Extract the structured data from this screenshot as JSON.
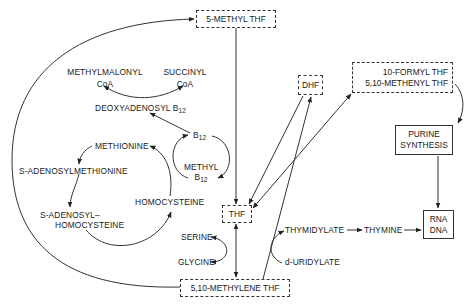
{
  "figure": {
    "type": "metabolic-pathway-diagram",
    "topic": "Folate / B12 one-carbon metabolism"
  },
  "nodes": {
    "methyl_thf": {
      "label": "5-METHYL THF",
      "style": "dashed-box"
    },
    "dhf": {
      "label": "DHF",
      "style": "dashed-box"
    },
    "formyl_thf": {
      "line1": "10-FORMYL THF",
      "line2": "5,10-METHENYL THF",
      "style": "dashed-box"
    },
    "purine": {
      "line1": "PURINE",
      "line2": "SYNTHESIS",
      "style": "solid-box"
    },
    "rna_dna": {
      "line1": "RNA",
      "line2": "DNA",
      "style": "solid-box"
    },
    "thf": {
      "label": "THF",
      "style": "dashed-box"
    },
    "methylene_thf": {
      "label": "5,10-METHYLENE THF",
      "style": "dashed-box"
    },
    "methylmalonyl": {
      "line1": "METHYLMALONYL",
      "line2": "CoA"
    },
    "succinyl": {
      "line1": "SUCCINYL",
      "line2": "CoA"
    },
    "deoxyadenosyl": {
      "text": "DEOXYADENOSYL B",
      "sub": "12"
    },
    "b12": {
      "text": "B",
      "sub": "12"
    },
    "methyl_b12": {
      "line1": "METHYL",
      "text": "B",
      "sub": "12"
    },
    "methionine": {
      "label": "METHIONINE"
    },
    "sam": {
      "label": "S-ADENOSYLMETHIONINE"
    },
    "sah": {
      "line1": "S-ADENOSYL–",
      "line2": "HOMOCYSTEINE"
    },
    "homocysteine": {
      "label": "HOMOCYSTEINE"
    },
    "serine": {
      "label": "SERINE"
    },
    "glycine": {
      "label": "GLYCINE"
    },
    "thymidylate": {
      "label": "THYMIDYLATE"
    },
    "thymine": {
      "label": "THYMINE"
    },
    "duridylate": {
      "label": "d-URIDYLATE"
    }
  },
  "edges": [
    {
      "from": "5-METHYL THF",
      "to": "THF"
    },
    {
      "from": "5,10-METHYLENE THF",
      "to": "5-METHYL THF",
      "shape": "large-arc-left"
    },
    {
      "from": "THF",
      "to": "5,10-METHYLENE THF",
      "bidirectional": true
    },
    {
      "from": "SERINE",
      "to": "GLYCINE",
      "shape": "curved",
      "coupled": "THF->5,10-METHYLENE THF"
    },
    {
      "from": "THF",
      "to": "DHF"
    },
    {
      "from": "DHF",
      "to": "THF"
    },
    {
      "from": "THF",
      "to": "10-FORMYL THF / 5,10-METHENYL THF",
      "bidirectional": true
    },
    {
      "from": "5,10-METHYLENE THF",
      "to": "DHF"
    },
    {
      "from": "10-FORMYL THF",
      "to": "PURINE SYNTHESIS",
      "shape": "curved"
    },
    {
      "from": "PURINE SYNTHESIS",
      "to": "RNA DNA"
    },
    {
      "from": "d-URIDYLATE",
      "to": "THYMIDYLATE",
      "shape": "curved"
    },
    {
      "from": "THYMIDYLATE",
      "to": "THYMINE"
    },
    {
      "from": "THYMINE",
      "to": "RNA DNA"
    },
    {
      "from": "B12",
      "to": "DEOXYADENOSYL B12"
    },
    {
      "from": "METHYLMALONYL CoA",
      "to": "SUCCINYL CoA",
      "shape": "curved",
      "bidirectional": true
    },
    {
      "from": "B12",
      "to": "METHYL B12",
      "shape": "cycle"
    },
    {
      "from": "METHIONINE",
      "to": "S-ADENOSYLMETHIONINE",
      "shape": "cycle"
    },
    {
      "from": "S-ADENOSYLMETHIONINE",
      "to": "S-ADENOSYL-HOMOCYSTEINE"
    },
    {
      "from": "S-ADENOSYL-HOMOCYSTEINE",
      "to": "HOMOCYSTEINE"
    },
    {
      "from": "HOMOCYSTEINE",
      "to": "METHIONINE"
    }
  ],
  "colors": {
    "ink": "#1a1a1a",
    "line": "#333333",
    "background": "#ffffff"
  }
}
